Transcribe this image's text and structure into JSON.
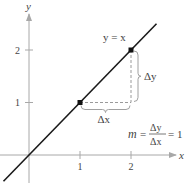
{
  "chart_data": {
    "type": "line",
    "title": "",
    "xlabel": "x",
    "ylabel": "y",
    "xlim": [
      -0.5,
      2.9
    ],
    "ylim": [
      -0.5,
      2.8
    ],
    "x_ticks": [
      1,
      2
    ],
    "y_ticks": [
      1,
      2
    ],
    "x_tick_labels": [
      "1",
      "2"
    ],
    "y_tick_labels": [
      "1",
      "2"
    ],
    "grid": false,
    "series": [
      {
        "name": "y = x",
        "slope": 1,
        "intercept": 0,
        "x_range": [
          -0.5,
          2.5
        ],
        "color": "#1a1a1a"
      }
    ],
    "points": [
      {
        "x": 1,
        "y": 1
      },
      {
        "x": 2,
        "y": 2
      }
    ],
    "annotations": {
      "line_label": "y = x",
      "delta_x": "Δx",
      "delta_y": "Δy",
      "slope_m": "m",
      "slope_eq": "=",
      "slope_num": "Δy",
      "slope_den": "Δx",
      "slope_result": "= 1"
    },
    "colors": {
      "axis": "#a8a8a8",
      "line": "#1a1a1a",
      "dashed": "#9a9a9a",
      "text": "#444444"
    }
  }
}
